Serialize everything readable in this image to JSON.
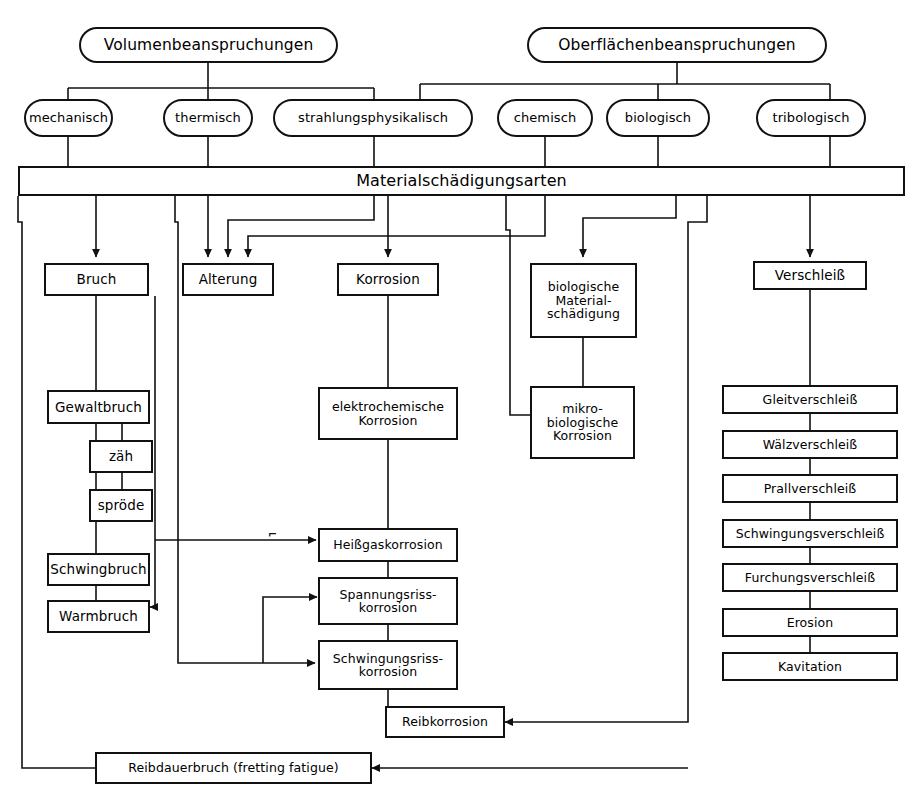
{
  "diagram": {
    "language": "de",
    "line_color": "#111111",
    "background": "#ffffff"
  },
  "roots": [
    {
      "id": "volumen",
      "label": "Volumenbeanspruchungen"
    },
    {
      "id": "oberflaeche",
      "label": "Oberflächenbeanspruchungen"
    }
  ],
  "load_types": [
    {
      "id": "mechanisch",
      "label": "mechanisch",
      "parent": "volumen"
    },
    {
      "id": "thermisch",
      "label": "thermisch",
      "parent": "volumen"
    },
    {
      "id": "strahlungsphysikalisch",
      "label": "strahlungsphysikalisch",
      "parent": "volumen"
    },
    {
      "id": "chemisch",
      "label": "chemisch",
      "parent": "oberflaeche"
    },
    {
      "id": "biologisch",
      "label": "biologisch",
      "parent": "oberflaeche"
    },
    {
      "id": "tribologisch",
      "label": "tribologisch",
      "parent": "oberflaeche"
    }
  ],
  "central_bar": {
    "id": "materialschaedigungsarten",
    "label": "Materialschädigungsarten"
  },
  "damage_categories": [
    {
      "id": "bruch",
      "label": "Bruch"
    },
    {
      "id": "alterung",
      "label": "Alterung"
    },
    {
      "id": "korrosion",
      "label": "Korrosion"
    },
    {
      "id": "biologische-materialschaedigung",
      "label": "biologische\nMaterial-\nschädigung"
    },
    {
      "id": "verschleiss",
      "label": "Verschleiß"
    }
  ],
  "bruch_branch": [
    {
      "id": "gewaltbruch",
      "label": "Gewaltbruch"
    },
    {
      "id": "zaeh",
      "label": "zäh"
    },
    {
      "id": "sproede",
      "label": "spröde"
    },
    {
      "id": "schwingbruch",
      "label": "Schwingbruch"
    },
    {
      "id": "warmbruch",
      "label": "Warmbruch"
    }
  ],
  "korrosion_branch": [
    {
      "id": "elektrochemische-korrosion",
      "label": "elektrochemische\nKorrosion"
    },
    {
      "id": "heissgaskorrosion",
      "label": "Heißgaskorrosion"
    },
    {
      "id": "spannungsrisskorrosion",
      "label": "Spannungsriss-\nkorrosion"
    },
    {
      "id": "schwingungsrisskorrosion",
      "label": "Schwingungsriss-\nkorrosion"
    }
  ],
  "biologisch_branch": [
    {
      "id": "mikrobiologische-korrosion",
      "label": "mikro-\nbiologische\nKorrosion"
    }
  ],
  "verschleiss_branch": [
    {
      "id": "gleitverschleiss",
      "label": "Gleitverschleiß"
    },
    {
      "id": "waelzverschleiss",
      "label": "Wälzverschleiß"
    },
    {
      "id": "prallverschleiss",
      "label": "Prallverschleiß"
    },
    {
      "id": "schwingungsverschleiss",
      "label": "Schwingungsverschleiß"
    },
    {
      "id": "furchungsverschleiss",
      "label": "Furchungsverschleiß"
    },
    {
      "id": "erosion",
      "label": "Erosion"
    },
    {
      "id": "kavitation",
      "label": "Kavitation"
    }
  ],
  "combined": [
    {
      "id": "reibkorrosion",
      "label": "Reibkorrosion"
    },
    {
      "id": "reibdauerbruch",
      "label": "Reibdauerbruch (fretting fatigue)"
    }
  ]
}
